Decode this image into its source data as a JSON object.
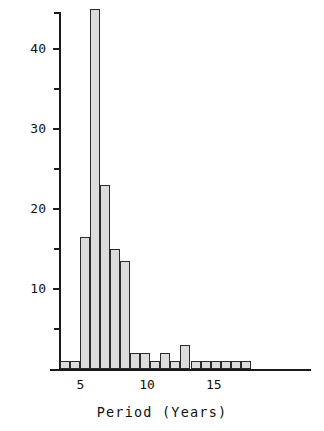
{
  "chart_data": {
    "type": "bar",
    "title": "",
    "subtitle": "",
    "xlabel": "Period (Years)",
    "ylabel": "Comet Count",
    "grid": false,
    "legend": null,
    "bin_width": 0.75,
    "xlim": [
      3.4,
      22.2
    ],
    "ylim": [
      0,
      44.6
    ],
    "x_ticks": [
      5,
      10,
      15
    ],
    "x_tick_labels": [
      "5",
      "10",
      "15"
    ],
    "y_ticks": [
      10,
      20,
      30,
      40
    ],
    "y_tick_labels": [
      "10",
      "20",
      "30",
      "40"
    ],
    "y_minor_ticks": [
      5,
      15,
      25,
      35,
      45
    ],
    "bin_starts": [
      3.5,
      4.25,
      5.0,
      5.75,
      6.5,
      7.25,
      8.0,
      8.75,
      9.5,
      10.25,
      11.0,
      11.75,
      12.5,
      13.25,
      14.0,
      14.75,
      15.5,
      16.25,
      17.0
    ],
    "bin_ends": [
      4.25,
      5.0,
      5.75,
      6.5,
      7.25,
      8.0,
      8.75,
      9.5,
      10.25,
      11.0,
      11.75,
      12.5,
      13.25,
      14.0,
      14.75,
      15.5,
      16.25,
      17.0,
      17.75
    ],
    "bin_centers": [
      3.875,
      4.625,
      5.375,
      6.125,
      6.875,
      7.625,
      8.375,
      9.125,
      9.875,
      10.625,
      11.375,
      12.125,
      12.875,
      13.625,
      14.375,
      15.125,
      15.875,
      16.625,
      17.375
    ],
    "categories": [
      "3.5-4.25",
      "4.25-5.0",
      "5.0-5.75",
      "5.75-6.5",
      "6.5-7.25",
      "7.25-8.0",
      "8.0-8.75",
      "8.75-9.5",
      "9.5-10.25",
      "10.25-11.0",
      "11.0-11.75",
      "11.75-12.5",
      "12.5-13.25",
      "13.25-14.0",
      "14.0-14.75",
      "14.75-15.5",
      "15.5-16.25",
      "16.25-17.0",
      "17.0-17.75"
    ],
    "values": [
      1,
      1,
      16.5,
      45,
      23,
      15,
      13.5,
      2,
      2,
      1,
      2,
      1,
      3,
      1,
      1,
      1,
      1,
      1,
      1
    ]
  },
  "chart_series_note": "",
  "bars": [
    {
      "label": "3.5-4.25",
      "value": 1
    },
    {
      "label": "4.25-5.0",
      "value": 1
    },
    {
      "label": "5.0-5.75",
      "value": 16.5
    },
    {
      "label": "5.75-6.5",
      "value": 45
    },
    {
      "label": "6.5-7.25",
      "value": 23
    },
    {
      "label": "7.25-8.0",
      "value": 15
    },
    {
      "label": "8.0-8.75",
      "value": 13.5
    },
    {
      "label": "8.75-9.5",
      "value": 2
    },
    {
      "label": "9.5-10.25",
      "value": 2
    },
    {
      "label": "10.25-11.0",
      "value": 1
    },
    {
      "label": "11.0-11.75",
      "value": 2
    },
    {
      "label": "11.75-12.5",
      "value": 1
    },
    {
      "label": "12.5-13.25",
      "value": 3
    },
    {
      "label": "13.25-14.0",
      "value": 1
    },
    {
      "label": "14.0-14.75",
      "value": 1
    },
    {
      "label": "14.75-15.5",
      "value": 1
    },
    {
      "label": "15.5-16.25",
      "value": 1
    },
    {
      "label": "16.25-17.0",
      "value": 1
    },
    {
      "label": "17.0-17.75",
      "value": 1
    }
  ],
  "axes": {
    "x_title": "Period (Years)",
    "y_title": "Comet Count",
    "x_labels": [
      "5",
      "10",
      "15"
    ],
    "y_labels": [
      "10",
      "20",
      "30",
      "40"
    ]
  },
  "colors": {
    "bar_fill": "#dcdcdc",
    "bar_stroke": "#2b2b2b",
    "axis": "#1a1a1a",
    "text": "#111111",
    "background": "#ffffff"
  }
}
